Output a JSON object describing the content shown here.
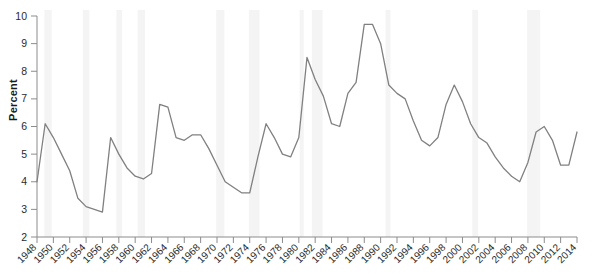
{
  "chart_data": {
    "type": "line",
    "title": "",
    "subtitle": "",
    "xlabel": "",
    "ylabel": "Percent",
    "xlim": [
      1948,
      2014
    ],
    "ylim": [
      2,
      10
    ],
    "grid": false,
    "legend": null,
    "legend_position": "none",
    "line_color": "#808080",
    "shading_color": "#f4f4f4",
    "axis_color": "#8c8c8c",
    "x_tick_labels": [
      "1948",
      "1950",
      "1952",
      "1954",
      "1956",
      "1958",
      "1960",
      "1962",
      "1964",
      "1966",
      "1968",
      "1970",
      "1972",
      "1974",
      "1976",
      "1978",
      "1980",
      "1982",
      "1984",
      "1986",
      "1988",
      "1990",
      "1992",
      "1994",
      "1996",
      "1998",
      "2000",
      "2002",
      "2004",
      "2006",
      "2008",
      "2010",
      "2012",
      "2014"
    ],
    "y_tick_labels": [
      "2",
      "3",
      "4",
      "5",
      "6",
      "7",
      "8",
      "9",
      "10"
    ],
    "y_ticks": [
      2,
      3,
      4,
      5,
      6,
      7,
      8,
      9,
      10
    ],
    "x_tick_step": 2,
    "series": [
      {
        "name": "Unemployment rate",
        "x": [
          1948,
          1949,
          1950,
          1951,
          1952,
          1953,
          1954,
          1955,
          1956,
          1957,
          1958,
          1959,
          1960,
          1961,
          1962,
          1963,
          1964,
          1965,
          1966,
          1967,
          1968,
          1969,
          1970,
          1971,
          1972,
          1973,
          1974,
          1975,
          1976,
          1977,
          1978,
          1979,
          1980,
          1981,
          1982,
          1983,
          1984,
          1985,
          1986,
          1987,
          1988,
          1989,
          1990,
          1991,
          1992,
          1993,
          1994,
          1995,
          1996,
          1997,
          1998,
          1999,
          2000,
          2001,
          2002,
          2003,
          2004,
          2005,
          2006,
          2007,
          2008,
          2009,
          2010,
          2011,
          2012,
          2013,
          2014
        ],
        "values": [
          4.0,
          6.1,
          5.6,
          5.0,
          4.4,
          3.4,
          3.1,
          3.0,
          2.9,
          5.6,
          5.0,
          4.5,
          4.2,
          4.1,
          4.3,
          6.8,
          6.7,
          5.6,
          5.5,
          5.7,
          5.7,
          5.2,
          4.6,
          4.0,
          3.8,
          3.6,
          3.6,
          4.9,
          6.1,
          5.6,
          5.0,
          4.9,
          5.6,
          8.5,
          7.7,
          7.1,
          6.1,
          6.0,
          7.2,
          7.6,
          9.7,
          9.7,
          9.0,
          7.5,
          7.2,
          7.0,
          6.2,
          5.5,
          5.3,
          5.6,
          6.8,
          7.5,
          6.9,
          6.1,
          5.6,
          5.4,
          4.9,
          4.5,
          4.2,
          4.0,
          4.7,
          5.8,
          6.0,
          5.5,
          4.6,
          4.6,
          5.8
        ]
      }
    ]
  },
  "recession_bands": [
    {
      "start": 1948.9,
      "end": 1949.8
    },
    {
      "start": 1953.6,
      "end": 1954.4
    },
    {
      "start": 1957.7,
      "end": 1958.4
    },
    {
      "start": 1960.3,
      "end": 1961.2
    },
    {
      "start": 1969.9,
      "end": 1970.9
    },
    {
      "start": 1973.9,
      "end": 1975.2
    },
    {
      "start": 1980.1,
      "end": 1980.6
    },
    {
      "start": 1981.6,
      "end": 1982.9
    },
    {
      "start": 1990.6,
      "end": 1991.2
    },
    {
      "start": 2001.2,
      "end": 2001.9
    },
    {
      "start": 2007.9,
      "end": 2009.5
    }
  ],
  "axes": {
    "y_axis_label": "Percent"
  }
}
